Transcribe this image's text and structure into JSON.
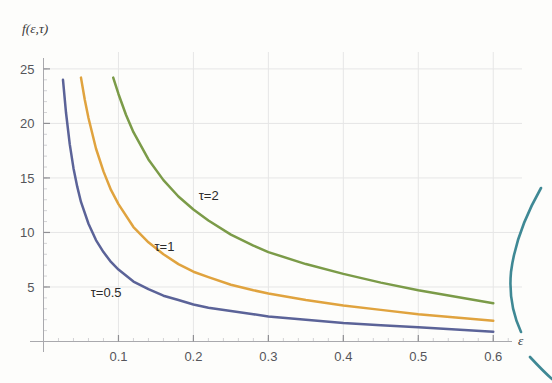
{
  "chart_data": {
    "type": "line",
    "title": "",
    "subtitle": "",
    "xlabel": "ε",
    "ylabel": "f(ε,τ)",
    "xlim": [
      0.0,
      0.625
    ],
    "ylim": [
      0.0,
      26.0
    ],
    "grid": true,
    "legend_position": "inline-annotations",
    "xticks": [
      0.1,
      0.2,
      0.3,
      0.4,
      0.5,
      0.6
    ],
    "xtick_labels": [
      "0.1",
      "0.2",
      "0.3",
      "0.4",
      "0.5",
      "0.6"
    ],
    "yticks": [
      5,
      10,
      15,
      20,
      25
    ],
    "ytick_labels": [
      "5",
      "10",
      "15",
      "20",
      "25"
    ],
    "series": [
      {
        "name": "τ=0.5",
        "label": "τ=0.5",
        "color": "#5b6398",
        "x": [
          0.026,
          0.03,
          0.035,
          0.04,
          0.045,
          0.05,
          0.06,
          0.07,
          0.08,
          0.09,
          0.1,
          0.12,
          0.14,
          0.16,
          0.18,
          0.2,
          0.22,
          0.25,
          0.28,
          0.3,
          0.35,
          0.4,
          0.45,
          0.5,
          0.55,
          0.6
        ],
        "y": [
          24.0,
          21.0,
          18.1,
          15.9,
          14.2,
          12.8,
          10.8,
          9.3,
          8.2,
          7.3,
          6.6,
          5.5,
          4.8,
          4.2,
          3.8,
          3.4,
          3.1,
          2.8,
          2.5,
          2.3,
          2.0,
          1.7,
          1.5,
          1.3,
          1.1,
          0.9
        ]
      },
      {
        "name": "τ=1",
        "label": "τ=1",
        "color": "#e0a33e",
        "x": [
          0.05,
          0.055,
          0.06,
          0.07,
          0.08,
          0.09,
          0.1,
          0.12,
          0.14,
          0.16,
          0.18,
          0.2,
          0.22,
          0.25,
          0.28,
          0.3,
          0.35,
          0.4,
          0.45,
          0.5,
          0.55,
          0.6
        ],
        "y": [
          24.2,
          22.2,
          20.5,
          17.7,
          15.6,
          13.9,
          12.6,
          10.5,
          9.1,
          8.0,
          7.1,
          6.4,
          5.9,
          5.2,
          4.7,
          4.4,
          3.8,
          3.3,
          2.9,
          2.5,
          2.2,
          1.9
        ]
      },
      {
        "name": "τ=2",
        "label": "τ=2",
        "color": "#7b9b48",
        "x": [
          0.093,
          0.1,
          0.11,
          0.12,
          0.14,
          0.16,
          0.18,
          0.2,
          0.22,
          0.25,
          0.28,
          0.3,
          0.35,
          0.4,
          0.45,
          0.5,
          0.55,
          0.6
        ],
        "y": [
          24.2,
          22.7,
          20.8,
          19.2,
          16.7,
          14.8,
          13.3,
          12.1,
          11.1,
          9.8,
          8.8,
          8.2,
          7.1,
          6.2,
          5.4,
          4.7,
          4.1,
          3.5
        ]
      }
    ],
    "annotations": [
      {
        "text": "τ=0.5",
        "x": 0.063,
        "y": 4.1,
        "series": "τ=0.5"
      },
      {
        "text": "τ=1",
        "x": 0.148,
        "y": 8.3,
        "series": "τ=1"
      },
      {
        "text": "τ=2",
        "x": 0.207,
        "y": 13.0,
        "series": "τ=2"
      }
    ]
  },
  "figure": {
    "y_axis_label": "f(ε,τ)",
    "x_axis_label": "ε",
    "background_color": "#fdfdfb",
    "grid_color": "#e6e6e6",
    "axis_color": "#9a9a9a",
    "artifact_color": "#2f7f8c"
  }
}
